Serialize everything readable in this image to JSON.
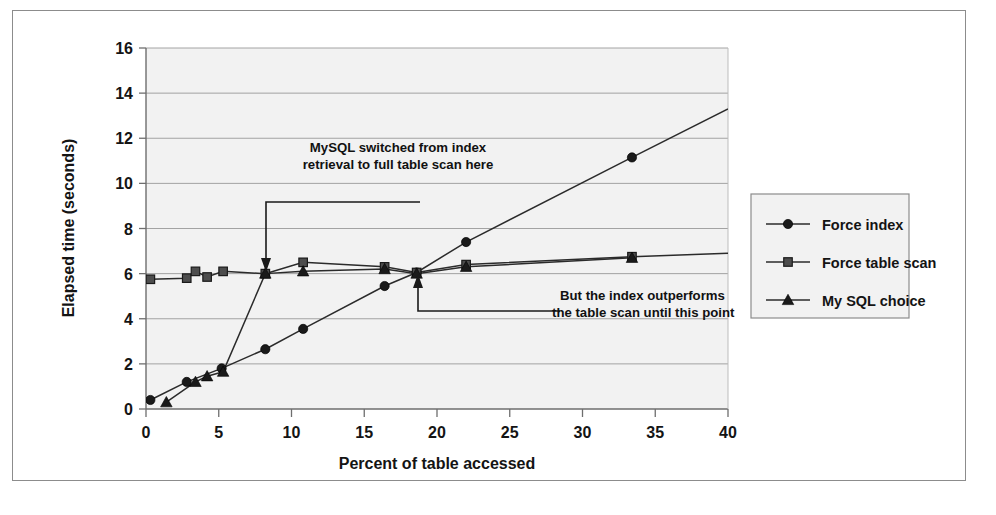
{
  "chart_data": {
    "type": "line",
    "title": "",
    "xlabel": "Percent of table accessed",
    "ylabel": "Elapsed time (seconds)",
    "xlim": [
      0,
      40
    ],
    "ylim": [
      0,
      16
    ],
    "xticks": [
      "0",
      "5",
      "10",
      "15",
      "20",
      "25",
      "30",
      "35",
      "40"
    ],
    "yticks": [
      "0",
      "2",
      "4",
      "6",
      "8",
      "10",
      "12",
      "14",
      "16"
    ],
    "grid": "horizontal",
    "legend_position": "right",
    "series": [
      {
        "name": "Force index",
        "marker": "circle",
        "color": "#1a1a1a",
        "points": [
          [
            0.3,
            0.4
          ],
          [
            2.8,
            1.2
          ],
          [
            5.2,
            1.8
          ],
          [
            8.2,
            2.65
          ],
          [
            10.8,
            3.55
          ],
          [
            16.4,
            5.45
          ],
          [
            18.6,
            6.05
          ],
          [
            22.0,
            7.4
          ],
          [
            33.4,
            11.15
          ],
          [
            40.0,
            13.3
          ]
        ]
      },
      {
        "name": "Force table scan",
        "marker": "square",
        "color": "#4d4d4d",
        "points": [
          [
            0.3,
            5.75
          ],
          [
            2.8,
            5.8
          ],
          [
            3.4,
            6.1
          ],
          [
            4.2,
            5.85
          ],
          [
            5.3,
            6.1
          ],
          [
            8.2,
            6.0
          ],
          [
            10.8,
            6.5
          ],
          [
            16.4,
            6.3
          ],
          [
            18.6,
            6.05
          ],
          [
            22.0,
            6.4
          ],
          [
            33.4,
            6.75
          ],
          [
            40.0,
            6.9
          ]
        ]
      },
      {
        "name": "My SQL choice",
        "marker": "triangle",
        "color": "#1a1a1a",
        "points": [
          [
            1.4,
            0.3
          ],
          [
            3.4,
            1.2
          ],
          [
            4.2,
            1.45
          ],
          [
            5.3,
            1.65
          ],
          [
            8.2,
            6.0
          ],
          [
            10.8,
            6.1
          ],
          [
            16.4,
            6.2
          ],
          [
            18.6,
            6.0
          ],
          [
            22.0,
            6.3
          ],
          [
            33.4,
            6.7
          ]
        ]
      }
    ],
    "annotations": [
      {
        "id": "annotation-switch",
        "line1": "MySQL switched from index",
        "line2": "retrieval to full table scan here",
        "target_x": 8.2,
        "target_y": 6.0
      },
      {
        "id": "annotation-crossover",
        "line1": "But the index outperforms",
        "line2": "the table scan until this point",
        "target_x": 18.6,
        "target_y": 6.05
      }
    ]
  },
  "legend": {
    "items": [
      {
        "label": "Force index",
        "marker": "circle"
      },
      {
        "label": "Force table scan",
        "marker": "square"
      },
      {
        "label": "My SQL choice",
        "marker": "triangle"
      }
    ]
  },
  "colors": {
    "plot_background": "#f2f2f2",
    "grid": "#9a9a9a",
    "axis": "#6e6e6e",
    "frame": "#8c8c8c",
    "text": "#141414"
  }
}
